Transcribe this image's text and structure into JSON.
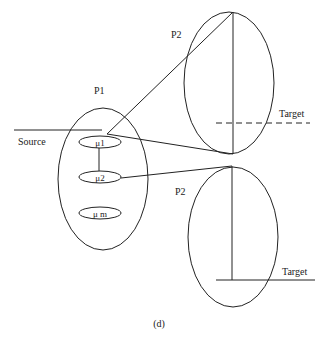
{
  "colors": {
    "background": "#ffffff",
    "stroke": "#222222"
  },
  "caption": "(d)",
  "source": {
    "label": "Source"
  },
  "p1": {
    "label": "P1",
    "units": [
      {
        "label": "μ1"
      },
      {
        "label": "μ2"
      },
      {
        "label": "μ m"
      }
    ]
  },
  "p2_top": {
    "label": "P2",
    "target_label": "Target",
    "target_style": "dashed"
  },
  "p2_bottom": {
    "label": "P2",
    "target_label": "Target",
    "target_style": "solid"
  }
}
